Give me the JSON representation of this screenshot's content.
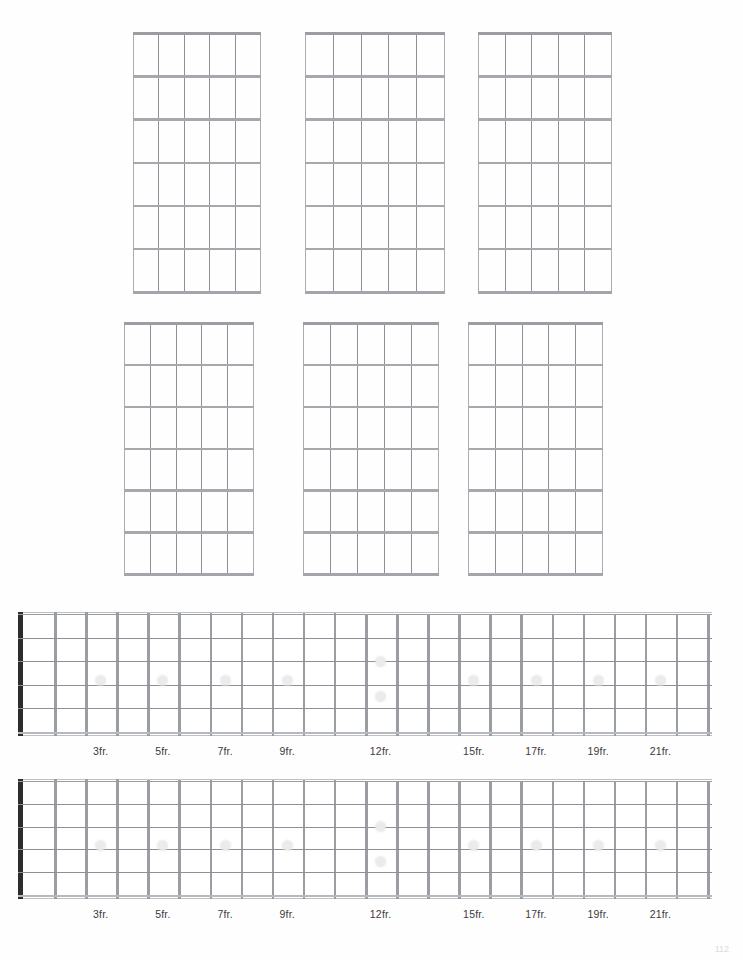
{
  "document": {
    "title": "Blank Guitar Chord and Fretboard Worksheet",
    "page_number": "112"
  },
  "chord_grids": {
    "label": "Blank chord box diagrams",
    "count": 6,
    "strings": 6,
    "frets": 6,
    "rows": 2,
    "columns": 3,
    "items": [
      {
        "id": "chord-grid-1",
        "row": 1,
        "col": 1,
        "markers": [],
        "fret_label": ""
      },
      {
        "id": "chord-grid-2",
        "row": 1,
        "col": 2,
        "markers": [],
        "fret_label": ""
      },
      {
        "id": "chord-grid-3",
        "row": 1,
        "col": 3,
        "markers": [],
        "fret_label": ""
      },
      {
        "id": "chord-grid-4",
        "row": 2,
        "col": 1,
        "markers": [],
        "fret_label": ""
      },
      {
        "id": "chord-grid-5",
        "row": 2,
        "col": 2,
        "markers": [],
        "fret_label": ""
      },
      {
        "id": "chord-grid-6",
        "row": 2,
        "col": 3,
        "markers": [],
        "fret_label": ""
      }
    ]
  },
  "fretboards": [
    {
      "id": "fretboard-1",
      "strings": 6,
      "fret_count": 22,
      "nut": true,
      "inlay_single_frets": [
        3,
        5,
        7,
        9,
        15,
        17,
        19,
        21
      ],
      "inlay_double_frets": [
        12
      ],
      "fret_labels": [
        "3fr.",
        "5fr.",
        "7fr.",
        "9fr.",
        "12fr.",
        "15fr.",
        "17fr.",
        "19fr.",
        "21fr."
      ],
      "fret_label_positions": [
        3,
        5,
        7,
        9,
        12,
        15,
        17,
        19,
        21
      ]
    },
    {
      "id": "fretboard-2",
      "strings": 6,
      "fret_count": 22,
      "nut": true,
      "inlay_single_frets": [
        3,
        5,
        7,
        9,
        15,
        17,
        19,
        21
      ],
      "inlay_double_frets": [
        12
      ],
      "fret_labels": [
        "3fr.",
        "5fr.",
        "7fr.",
        "9fr.",
        "12fr.",
        "15fr.",
        "17fr.",
        "19fr.",
        "21fr."
      ],
      "fret_label_positions": [
        3,
        5,
        7,
        9,
        12,
        15,
        17,
        19,
        21
      ]
    }
  ],
  "colors": {
    "background": "#ffffff",
    "grid_line": "#9a9da2",
    "string_line": "#8d9095",
    "nut": "#2c2c2c",
    "inlay_dot": "#ebebeb",
    "label_text": "#3b3b3b"
  }
}
